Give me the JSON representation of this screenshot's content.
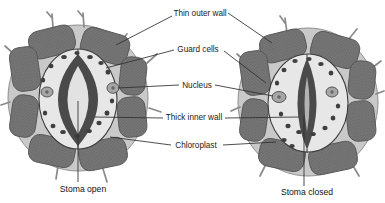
{
  "labels": {
    "thin_outer_wall": "Thin outer wall",
    "guard_cells": "Guard cells",
    "nucleus": "Nucleus",
    "thick_inner_wall": "Thick inner wall",
    "chloroplast": "Chloroplast",
    "stoma_open": "Stoma open",
    "stoma_closed": "Stoma closed"
  },
  "colors": {
    "background": "#ffffff",
    "epidermal_cell": "#767676",
    "epidermal_stipple": "#5c5c5c",
    "cell_wall_channel": "#c9c9c9",
    "cluster_outline": "#8f8f8f",
    "guard_cell": "#e7e7e7",
    "guard_outline": "#3d3d3d",
    "thick_inner_wall": "#4a4a4a",
    "stoma_pore_open": "#e2e2e2",
    "stoma_slit_closed": "#b2b2b2",
    "chloroplast": "#3f3f3f",
    "nucleus": "#a6a6a6",
    "nucleus_dot": "#666666",
    "leader_line": "#2e2e2e",
    "text": "#1a1a1a"
  }
}
